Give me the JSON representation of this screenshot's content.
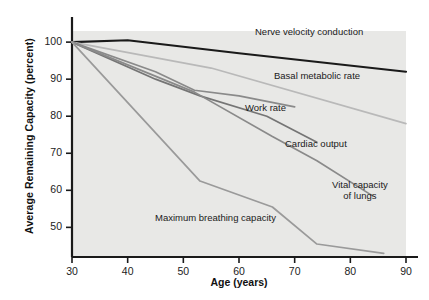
{
  "chart_data": {
    "type": "line",
    "title": "",
    "xlabel": "Age (years)",
    "ylabel": "Average Remaining Capacity (percent)",
    "xlim": [
      30,
      90
    ],
    "ylim": [
      42,
      103
    ],
    "xticks": [
      30,
      40,
      50,
      60,
      70,
      80,
      90
    ],
    "yticks": [
      50,
      60,
      70,
      80,
      90,
      100
    ],
    "grid": false,
    "legend_position": "inline-annotations",
    "plot_background": "#e8e8e6",
    "series": [
      {
        "name": "Nerve velocity conduction",
        "color": "#1a1a1a",
        "width": 2.2,
        "x": [
          30,
          40,
          60,
          90
        ],
        "y": [
          100,
          100.5,
          97,
          92
        ],
        "label": "Nerve velocity conduction",
        "label_x": 255,
        "label_y": 27
      },
      {
        "name": "Basal metabolic rate",
        "color": "#b9b9b9",
        "width": 1.7,
        "x": [
          30,
          55,
          90
        ],
        "y": [
          100,
          93,
          78
        ],
        "label": "Basal metabolic rate",
        "label_x": 274,
        "label_y": 71
      },
      {
        "name": "Work rate",
        "color": "#8a8a8a",
        "width": 1.7,
        "x": [
          30,
          45,
          52,
          60,
          70
        ],
        "y": [
          100,
          92,
          87,
          85.5,
          82.5
        ],
        "label": "Work rate",
        "label_x": 245,
        "label_y": 103
      },
      {
        "name": "Cardiac output",
        "color": "#757575",
        "width": 1.7,
        "x": [
          30,
          45,
          53,
          65,
          74
        ],
        "y": [
          100,
          90,
          85.5,
          80,
          73
        ],
        "label": "Cardiac output",
        "label_x": 285,
        "label_y": 139
      },
      {
        "name": "Vital capacity of lungs",
        "color": "#8a8a8a",
        "width": 1.7,
        "x": [
          30,
          52,
          66,
          74,
          84
        ],
        "y": [
          100,
          86.5,
          74.5,
          68,
          58.5
        ],
        "label_line1": "Vital capacity",
        "label_line2": "of lungs",
        "label_x": 332,
        "label_y": 180
      },
      {
        "name": "Maximum breathing capacity",
        "color": "#9a9a9a",
        "width": 1.7,
        "x": [
          30,
          53,
          66,
          74,
          86
        ],
        "y": [
          100,
          62.5,
          55.5,
          45.5,
          43
        ],
        "label": "Maximum breathing capacity",
        "label_x": 155,
        "label_y": 213
      }
    ]
  },
  "axes": {
    "x_tick_labels": [
      "30",
      "40",
      "50",
      "60",
      "70",
      "80",
      "90"
    ],
    "y_tick_labels": [
      "50",
      "60",
      "70",
      "80",
      "90",
      "100"
    ]
  }
}
